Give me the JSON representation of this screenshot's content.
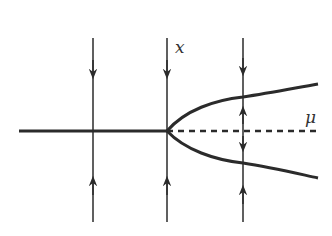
{
  "diagram": {
    "type": "pitchfork-bifurcation",
    "axis_labels": {
      "state": "x",
      "parameter": "μ"
    },
    "colors": {
      "stroke": "#2b2b2b",
      "background": "#ffffff"
    },
    "branches": [
      {
        "name": "stable-zero-branch",
        "style": "solid",
        "range": "μ<0"
      },
      {
        "name": "unstable-zero-branch",
        "style": "dashed",
        "range": "μ>0"
      },
      {
        "name": "upper-stable-branch",
        "style": "solid",
        "range": "μ>0"
      },
      {
        "name": "lower-stable-branch",
        "style": "solid",
        "range": "μ>0"
      }
    ],
    "flow_lines": [
      {
        "position": "μ<0",
        "arrows": [
          "down-toward-axis",
          "up-toward-axis"
        ]
      },
      {
        "position": "μ=0",
        "arrows": [
          "down-toward-axis",
          "up-toward-axis"
        ]
      },
      {
        "position": "μ>0",
        "arrows": [
          "down-toward-upper-branch",
          "up-toward-upper-branch",
          "down-toward-lower-branch",
          "up-toward-lower-branch"
        ]
      }
    ]
  }
}
